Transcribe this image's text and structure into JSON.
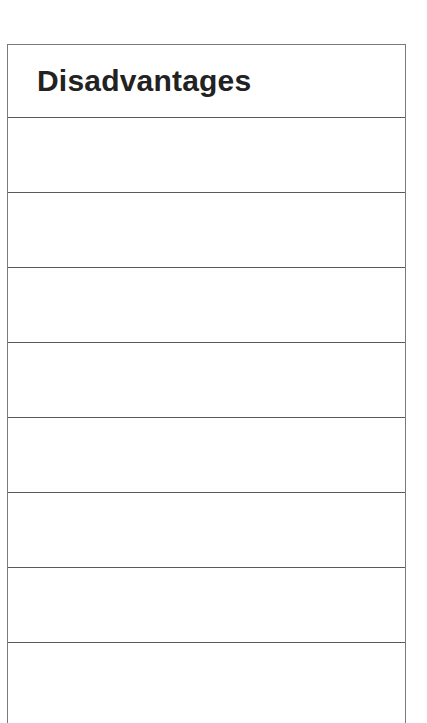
{
  "table": {
    "header": {
      "title": "Disadvantages"
    },
    "rows": [
      "",
      "",
      "",
      "",
      "",
      "",
      "",
      ""
    ],
    "colors": {
      "border": "#5a5a5a",
      "text": "#222222",
      "background": "#ffffff"
    }
  }
}
